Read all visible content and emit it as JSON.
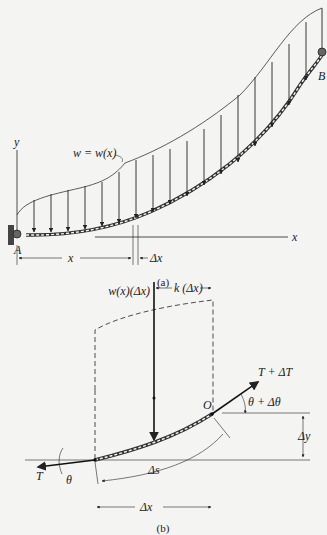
{
  "figure_a": {
    "caption": "(a)",
    "axis_y_label": "y",
    "axis_x_label": "x",
    "load_label": "w = w(x)",
    "support_left_label": "A",
    "support_right_label": "B",
    "dim_x_label": "x",
    "dim_dx_label": "Δx"
  },
  "figure_b": {
    "caption": "(b)",
    "resultant_label": "w(x)(Δx)",
    "moment_arm_label": "k (Δx)",
    "tension_right_label": "T + ΔT",
    "angle_right_label": "θ + Δθ",
    "point_o_label": "O",
    "dy_label": "Δy",
    "ds_label": "Δs",
    "dx_label": "Δx",
    "tension_left_label": "T",
    "angle_left_label": "θ"
  }
}
